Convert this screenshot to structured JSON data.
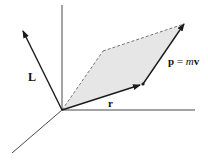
{
  "diagram": {
    "labels": {
      "L": "L",
      "r": "r",
      "p_bold": "p",
      "equals": " = ",
      "m": "m",
      "v": "v"
    },
    "colors": {
      "stroke": "#1a1a1a",
      "fill": "#e6e6e6",
      "background": "#ffffff"
    }
  }
}
